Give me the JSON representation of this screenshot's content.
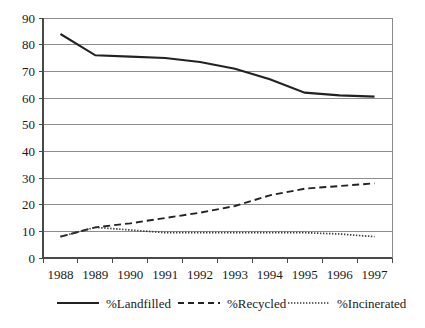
{
  "chart_data": {
    "type": "line",
    "title": "",
    "subtitle": "",
    "xlabel": "",
    "ylabel": "",
    "categories": [
      "1988",
      "1989",
      "1990",
      "1991",
      "1992",
      "1993",
      "1994",
      "1995",
      "1996",
      "1997"
    ],
    "x": [
      "1989",
      "1990",
      "1991",
      "1992",
      "1993",
      "1994",
      "1995",
      "1996",
      "1997"
    ],
    "series": [
      {
        "name": "%Landfilled",
        "style": "solid",
        "color": "#222222",
        "values": [
          84,
          76,
          75.5,
          75,
          73.5,
          71,
          67,
          62,
          61,
          60.5
        ]
      },
      {
        "name": "%Recycled",
        "style": "dashed",
        "color": "#222222",
        "values": [
          8,
          11.5,
          13,
          15,
          17,
          19.5,
          23.5,
          26,
          27,
          28
        ]
      },
      {
        "name": "%Incinerated",
        "style": "dotted",
        "color": "#3a3a3a",
        "values": [
          8,
          11.5,
          10.5,
          9.5,
          9.5,
          9.5,
          9.5,
          9.5,
          9,
          8
        ]
      }
    ],
    "ylim": [
      0,
      90
    ],
    "ytick_step": 10,
    "yticks": [
      "0",
      "10",
      "20",
      "30",
      "40",
      "50",
      "60",
      "70",
      "80",
      "90"
    ],
    "grid": true,
    "grid_axis": "y",
    "legend_position": "bottom",
    "legend": [
      "%Landfilled",
      "%Recycled",
      "%Incinerated"
    ]
  },
  "axes": {
    "y_labels": [
      "90",
      "80",
      "70",
      "60",
      "50",
      "40",
      "30",
      "20",
      "10",
      "0"
    ],
    "x_labels": [
      "1988",
      "1989",
      "1990",
      "1991",
      "1992",
      "1993",
      "1994",
      "1995",
      "1996",
      "1997"
    ]
  },
  "legend": {
    "items": [
      {
        "label": "%Landfilled",
        "swatch": "solid-line-icon"
      },
      {
        "label": "%Recycled",
        "swatch": "dashed-line-icon"
      },
      {
        "label": "%Incinerated",
        "swatch": "dotted-line-icon"
      }
    ]
  },
  "colors": {
    "background": "#ffffff",
    "gridline": "#8c8c8c",
    "axis": "#4a4a4a",
    "text": "#1a1a1a",
    "landfilled": "#222222",
    "recycled": "#222222",
    "incinerated": "#3a3a3a"
  }
}
